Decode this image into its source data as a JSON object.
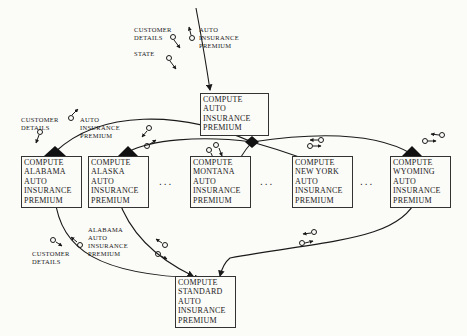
{
  "diagram": {
    "type": "structure-chart",
    "modules": {
      "main": [
        "COMPUTE",
        "AUTO",
        "INSURANCE",
        "PREMIUM"
      ],
      "alabama": [
        "COMPUTE",
        "ALABAMA",
        "AUTO",
        "INSURANCE",
        "PREMIUM"
      ],
      "alaska": [
        "COMPUTE",
        "ALASKA",
        "AUTO",
        "INSURANCE",
        "PREMIUM"
      ],
      "montana": [
        "COMPUTE",
        "MONTANA",
        "AUTO",
        "INSURANCE",
        "PREMIUM"
      ],
      "new_york": [
        "COMPUTE",
        "NEW YORK",
        "AUTO",
        "INSURANCE",
        "PREMIUM"
      ],
      "wyoming": [
        "COMPUTE",
        "WYOMING",
        "AUTO",
        "INSURANCE",
        "PREMIUM"
      ],
      "standard": [
        "COMPUTE",
        "STANDARD",
        "AUTO",
        "INSURANCE",
        "PREMIUM"
      ]
    },
    "labels": {
      "top_customer_details": [
        "CUSTOMER",
        "DETAILS"
      ],
      "top_state": [
        "STATE"
      ],
      "top_premium": [
        "AUTO",
        "INSURANCE",
        "PREMIUM"
      ],
      "left_customer_details": [
        "CUSTOMER",
        "DETAILS"
      ],
      "left_premium": [
        "AUTO",
        "INSURANCE",
        "PREMIUM"
      ],
      "bottom_customer_details": [
        "CUSTOMER",
        "DETAILS"
      ],
      "bottom_alabama_premium": [
        "ALABAMA",
        "AUTO",
        "INSURANCE",
        "PREMIUM"
      ]
    },
    "ellipsis": "..."
  }
}
